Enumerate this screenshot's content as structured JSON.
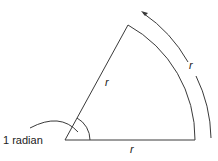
{
  "diagram": {
    "labels": {
      "angle": "1 radian",
      "radius_upper": "r",
      "radius_lower": "r",
      "arc": "r"
    },
    "colors": {
      "line": "#3a3a3a",
      "background": "#ffffff"
    }
  }
}
